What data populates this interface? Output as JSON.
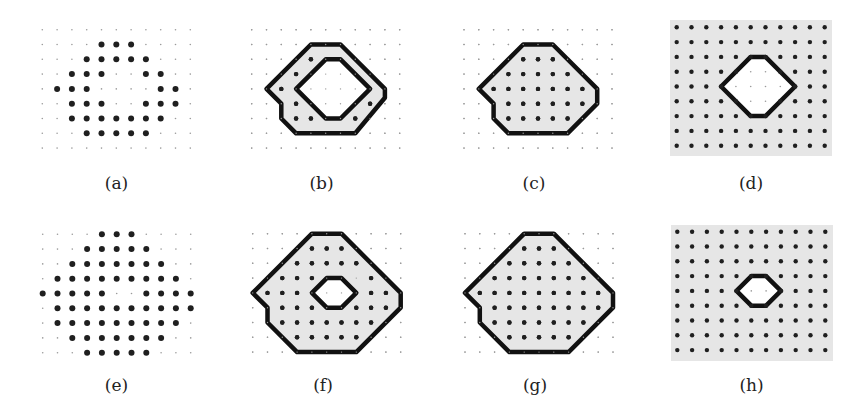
{
  "figure": {
    "grid": {
      "cols": 11,
      "rows": 9,
      "spacing": 14.8
    },
    "colors": {
      "shade": "#e6e6e6",
      "dot": "#1f1f1f",
      "small_dot": "#9a9a9a",
      "outline": "#111111"
    },
    "panels": [
      {
        "id": "a",
        "label": "(a)",
        "origin": [
          42.3,
          29.7
        ],
        "label_pos": [
          116.5,
          173
        ],
        "background": null,
        "big_dots": [
          [
            1,
            4
          ],
          [
            1,
            5
          ],
          [
            1,
            6
          ],
          [
            2,
            3
          ],
          [
            2,
            4
          ],
          [
            2,
            5
          ],
          [
            2,
            6
          ],
          [
            2,
            7
          ],
          [
            3,
            2
          ],
          [
            3,
            3
          ],
          [
            3,
            4
          ],
          [
            3,
            7
          ],
          [
            3,
            8
          ],
          [
            4,
            1
          ],
          [
            4,
            2
          ],
          [
            4,
            3
          ],
          [
            4,
            8
          ],
          [
            4,
            9
          ],
          [
            5,
            2
          ],
          [
            5,
            3
          ],
          [
            5,
            4
          ],
          [
            5,
            7
          ],
          [
            5,
            8
          ],
          [
            5,
            9
          ],
          [
            6,
            2
          ],
          [
            6,
            3
          ],
          [
            6,
            4
          ],
          [
            6,
            5
          ],
          [
            6,
            6
          ],
          [
            6,
            7
          ],
          [
            6,
            8
          ],
          [
            7,
            3
          ],
          [
            7,
            4
          ],
          [
            7,
            5
          ],
          [
            7,
            6
          ],
          [
            7,
            7
          ]
        ],
        "polygons": []
      },
      {
        "id": "b",
        "label": "(b)",
        "origin": [
          251.7,
          29.7
        ],
        "label_pos": [
          321.5,
          173
        ],
        "background": null,
        "big_dots": [
          [
            2,
            4
          ],
          [
            3,
            3
          ],
          [
            4,
            2
          ],
          [
            5,
            3
          ],
          [
            6,
            3
          ],
          [
            6,
            4
          ],
          [
            6,
            7
          ],
          [
            5,
            8
          ]
        ],
        "polygons": [
          {
            "role": "outer",
            "fill": "shade",
            "points": [
              [
                4,
                1
              ],
              [
                6,
                1
              ],
              [
                9,
                4
              ],
              [
                9,
                4.6
              ],
              [
                7,
                7
              ],
              [
                3,
                7
              ],
              [
                2,
                6
              ],
              [
                2,
                5
              ],
              [
                1,
                4
              ]
            ]
          },
          {
            "role": "hole",
            "fill": "white",
            "points": [
              [
                5,
                2
              ],
              [
                6,
                2
              ],
              [
                8,
                4
              ],
              [
                6,
                6
              ],
              [
                5,
                6
              ],
              [
                3,
                4
              ]
            ]
          }
        ]
      },
      {
        "id": "c",
        "label": "(c)",
        "origin": [
          464,
          29.7
        ],
        "label_pos": [
          534,
          173
        ],
        "background": null,
        "big_dots": [
          [
            2,
            4
          ],
          [
            2,
            5
          ],
          [
            2,
            6
          ],
          [
            3,
            3
          ],
          [
            3,
            4
          ],
          [
            3,
            5
          ],
          [
            3,
            6
          ],
          [
            3,
            7
          ],
          [
            4,
            2
          ],
          [
            4,
            3
          ],
          [
            4,
            4
          ],
          [
            4,
            5
          ],
          [
            4,
            6
          ],
          [
            4,
            7
          ],
          [
            4,
            8
          ],
          [
            5,
            3
          ],
          [
            5,
            4
          ],
          [
            5,
            5
          ],
          [
            5,
            6
          ],
          [
            5,
            7
          ],
          [
            5,
            8
          ],
          [
            6,
            3
          ],
          [
            6,
            4
          ],
          [
            6,
            5
          ],
          [
            6,
            6
          ],
          [
            6,
            7
          ]
        ],
        "polygons": [
          {
            "role": "outer",
            "fill": "shade",
            "points": [
              [
                4,
                1
              ],
              [
                6,
                1
              ],
              [
                9,
                4
              ],
              [
                9,
                5
              ],
              [
                7,
                7
              ],
              [
                3,
                7
              ],
              [
                2,
                6
              ],
              [
                2,
                5
              ],
              [
                1,
                4
              ]
            ]
          }
        ]
      },
      {
        "id": "d",
        "label": "(d)",
        "origin": [
          676.7,
          27.3
        ],
        "label_pos": [
          751,
          173
        ],
        "background": {
          "x": 670,
          "y": 20,
          "w": 162,
          "h": 136
        },
        "big_dots": "all_except_hole",
        "hole_dots": [
          [
            3,
            5
          ],
          [
            3,
            6
          ],
          [
            4,
            4
          ],
          [
            4,
            5
          ],
          [
            4,
            6
          ],
          [
            4,
            7
          ],
          [
            5,
            5
          ],
          [
            5,
            6
          ]
        ],
        "polygons": [
          {
            "role": "hole",
            "fill": "white",
            "points": [
              [
                5,
                2
              ],
              [
                6,
                2
              ],
              [
                8,
                4
              ],
              [
                6,
                6
              ],
              [
                5,
                6
              ],
              [
                3,
                4
              ]
            ]
          }
        ]
      },
      {
        "id": "e",
        "label": "(e)",
        "origin": [
          42.7,
          234.3
        ],
        "label_pos": [
          116.5,
          375
        ],
        "background": null,
        "big_dots": [
          [
            0,
            4
          ],
          [
            0,
            5
          ],
          [
            0,
            6
          ],
          [
            1,
            3
          ],
          [
            1,
            4
          ],
          [
            1,
            5
          ],
          [
            1,
            6
          ],
          [
            1,
            7
          ],
          [
            2,
            2
          ],
          [
            2,
            3
          ],
          [
            2,
            4
          ],
          [
            2,
            5
          ],
          [
            2,
            6
          ],
          [
            2,
            7
          ],
          [
            2,
            8
          ],
          [
            3,
            1
          ],
          [
            3,
            2
          ],
          [
            3,
            3
          ],
          [
            3,
            4
          ],
          [
            3,
            5
          ],
          [
            3,
            6
          ],
          [
            3,
            7
          ],
          [
            3,
            8
          ],
          [
            3,
            9
          ],
          [
            4,
            0
          ],
          [
            4,
            1
          ],
          [
            4,
            2
          ],
          [
            4,
            3
          ],
          [
            4,
            4
          ],
          [
            4,
            7
          ],
          [
            4,
            8
          ],
          [
            4,
            9
          ],
          [
            4,
            10
          ],
          [
            5,
            1
          ],
          [
            5,
            2
          ],
          [
            5,
            3
          ],
          [
            5,
            4
          ],
          [
            5,
            5
          ],
          [
            5,
            6
          ],
          [
            5,
            7
          ],
          [
            5,
            8
          ],
          [
            5,
            9
          ],
          [
            5,
            10
          ],
          [
            6,
            1
          ],
          [
            6,
            2
          ],
          [
            6,
            3
          ],
          [
            6,
            4
          ],
          [
            6,
            5
          ],
          [
            6,
            6
          ],
          [
            6,
            7
          ],
          [
            6,
            8
          ],
          [
            6,
            9
          ],
          [
            7,
            2
          ],
          [
            7,
            3
          ],
          [
            7,
            4
          ],
          [
            7,
            5
          ],
          [
            7,
            6
          ],
          [
            7,
            7
          ],
          [
            7,
            8
          ],
          [
            8,
            3
          ],
          [
            8,
            4
          ],
          [
            8,
            5
          ],
          [
            8,
            6
          ],
          [
            8,
            7
          ]
        ],
        "polygons": []
      },
      {
        "id": "f",
        "label": "(f)",
        "origin": [
          252.7,
          233.7
        ],
        "label_pos": [
          323,
          375
        ],
        "background": null,
        "big_dots": [
          [
            1,
            4
          ],
          [
            1,
            5
          ],
          [
            1,
            6
          ],
          [
            2,
            3
          ],
          [
            2,
            4
          ],
          [
            2,
            5
          ],
          [
            2,
            6
          ],
          [
            2,
            7
          ],
          [
            3,
            2
          ],
          [
            3,
            3
          ],
          [
            3,
            4
          ],
          [
            3,
            8
          ],
          [
            4,
            1
          ],
          [
            4,
            2
          ],
          [
            4,
            3
          ],
          [
            4,
            8
          ],
          [
            4,
            9
          ],
          [
            5,
            2
          ],
          [
            5,
            3
          ],
          [
            5,
            4
          ],
          [
            5,
            7
          ],
          [
            5,
            8
          ],
          [
            5,
            9
          ],
          [
            6,
            2
          ],
          [
            6,
            3
          ],
          [
            6,
            4
          ],
          [
            6,
            5
          ],
          [
            6,
            6
          ],
          [
            6,
            7
          ],
          [
            6,
            8
          ],
          [
            7,
            3
          ],
          [
            7,
            4
          ],
          [
            7,
            5
          ],
          [
            7,
            6
          ],
          [
            7,
            7
          ]
        ],
        "polygons": [
          {
            "role": "outer",
            "fill": "shade",
            "points": [
              [
                4,
                0
              ],
              [
                6,
                0
              ],
              [
                10,
                4
              ],
              [
                10,
                5
              ],
              [
                7,
                8
              ],
              [
                3,
                8
              ],
              [
                1,
                6
              ],
              [
                1,
                5
              ],
              [
                0,
                4
              ]
            ]
          },
          {
            "role": "hole",
            "fill": "white",
            "points": [
              [
                5,
                3
              ],
              [
                6,
                3
              ],
              [
                7,
                4
              ],
              [
                6,
                5
              ],
              [
                5,
                5
              ],
              [
                4,
                4
              ]
            ]
          }
        ]
      },
      {
        "id": "g",
        "label": "(g)",
        "origin": [
          465,
          233.7
        ],
        "label_pos": [
          535,
          375
        ],
        "background": null,
        "big_dots": [
          [
            1,
            4
          ],
          [
            1,
            5
          ],
          [
            1,
            6
          ],
          [
            2,
            3
          ],
          [
            2,
            4
          ],
          [
            2,
            5
          ],
          [
            2,
            6
          ],
          [
            2,
            7
          ],
          [
            3,
            2
          ],
          [
            3,
            3
          ],
          [
            3,
            4
          ],
          [
            3,
            5
          ],
          [
            3,
            6
          ],
          [
            3,
            7
          ],
          [
            3,
            8
          ],
          [
            4,
            1
          ],
          [
            4,
            2
          ],
          [
            4,
            3
          ],
          [
            4,
            4
          ],
          [
            4,
            5
          ],
          [
            4,
            6
          ],
          [
            4,
            7
          ],
          [
            4,
            8
          ],
          [
            4,
            9
          ],
          [
            5,
            2
          ],
          [
            5,
            3
          ],
          [
            5,
            4
          ],
          [
            5,
            5
          ],
          [
            5,
            6
          ],
          [
            5,
            7
          ],
          [
            5,
            8
          ],
          [
            5,
            9
          ],
          [
            6,
            2
          ],
          [
            6,
            3
          ],
          [
            6,
            4
          ],
          [
            6,
            5
          ],
          [
            6,
            6
          ],
          [
            6,
            7
          ],
          [
            6,
            8
          ],
          [
            7,
            3
          ],
          [
            7,
            4
          ],
          [
            7,
            5
          ],
          [
            7,
            6
          ],
          [
            7,
            7
          ]
        ],
        "polygons": [
          {
            "role": "outer",
            "fill": "shade",
            "points": [
              [
                4,
                0
              ],
              [
                6,
                0
              ],
              [
                10,
                4
              ],
              [
                10,
                5
              ],
              [
                7,
                8
              ],
              [
                3,
                8
              ],
              [
                1,
                6
              ],
              [
                1,
                5
              ],
              [
                0,
                4
              ]
            ]
          }
        ]
      },
      {
        "id": "h",
        "label": "(h)",
        "origin": [
          677.3,
          231.7
        ],
        "label_pos": [
          751.5,
          375
        ],
        "background": {
          "x": 671,
          "y": 225,
          "w": 162,
          "h": 136
        },
        "big_dots": "all_except_hole",
        "hole_dots": [
          [
            4,
            5
          ],
          [
            4,
            6
          ]
        ],
        "polygons": [
          {
            "role": "hole",
            "fill": "white",
            "points": [
              [
                5,
                3
              ],
              [
                6,
                3
              ],
              [
                7,
                4
              ],
              [
                6,
                5
              ],
              [
                5,
                5
              ],
              [
                4,
                4
              ]
            ]
          }
        ]
      }
    ]
  }
}
